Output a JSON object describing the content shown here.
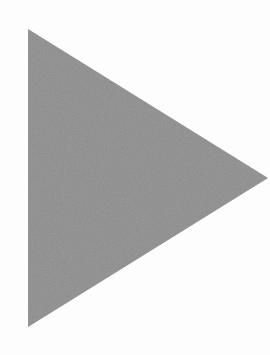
{
  "shape": {
    "type": "triangle",
    "direction": "right",
    "semantic": "play-icon",
    "fill": "#8e8e8e",
    "background": "#fdfdfd",
    "points": [
      [
        28,
        29
      ],
      [
        268,
        178
      ],
      [
        28,
        327
      ]
    ]
  }
}
